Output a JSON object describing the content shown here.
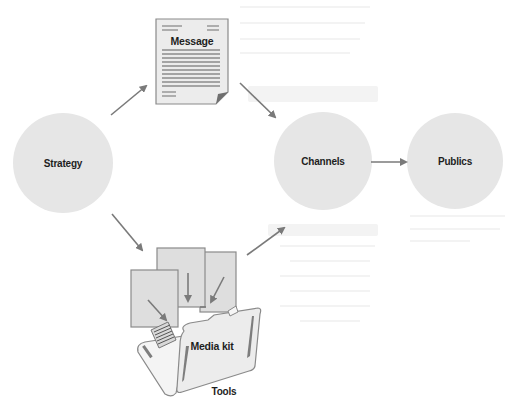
{
  "diagram": {
    "nodes": {
      "strategy": {
        "label": "Strategy",
        "shape": "circle"
      },
      "message": {
        "label": "Message",
        "shape": "document-icon"
      },
      "channels": {
        "label": "Channels",
        "shape": "circle"
      },
      "publics": {
        "label": "Publics",
        "shape": "circle"
      },
      "media_kit": {
        "label": "Media kit",
        "shape": "folder-icon"
      },
      "tools": {
        "label": "Tools"
      }
    },
    "edges": [
      {
        "from": "Strategy",
        "to": "Message"
      },
      {
        "from": "Message",
        "to": "Channels"
      },
      {
        "from": "Strategy",
        "to": "Media kit"
      },
      {
        "from": "Media kit",
        "to": "Channels"
      },
      {
        "from": "Channels",
        "to": "Publics"
      }
    ],
    "colors": {
      "circle_fill": "#e6e6e6",
      "arrow": "#7a7a7a",
      "label": "#1e1e1e"
    }
  }
}
